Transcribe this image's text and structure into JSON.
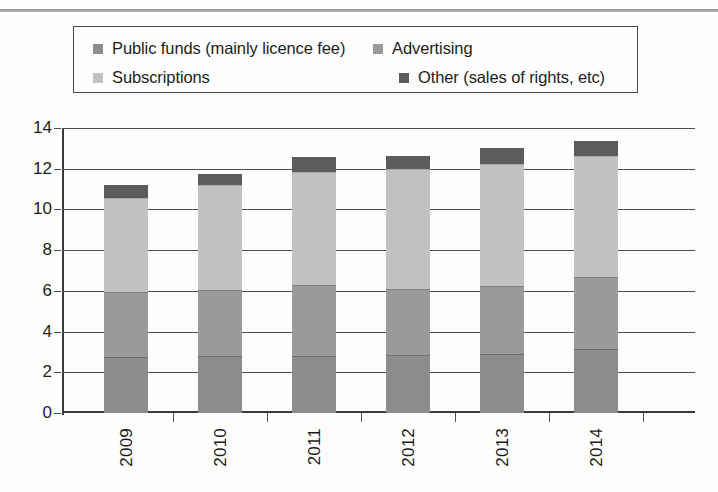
{
  "top_caption": "",
  "legend": {
    "items": [
      {
        "label": "Public funds (mainly licence fee)",
        "color": "#8d8d8d",
        "key": "public_funds"
      },
      {
        "label": "Advertising",
        "color": "#9a9a9a",
        "key": "advertising"
      },
      {
        "label": "Subscriptions",
        "color": "#c2c2c2",
        "key": "subscriptions"
      },
      {
        "label": "Other (sales of rights, etc)",
        "color": "#5c5c5c",
        "key": "other"
      }
    ]
  },
  "axis": {
    "y_ticks": [
      "0",
      "2",
      "4",
      "6",
      "8",
      "10",
      "12",
      "14"
    ],
    "x_ticks": [
      "2009",
      "2010",
      "2011",
      "2012",
      "2013",
      "2014"
    ]
  },
  "chart_data": {
    "type": "bar",
    "stacked": true,
    "title": "",
    "subtitle": "",
    "xlabel": "",
    "ylabel": "",
    "ylim": [
      0,
      14
    ],
    "ytick_step": 2,
    "grid": true,
    "legend_position": "top",
    "orientation": "vertical",
    "categories": [
      "2009",
      "2010",
      "2011",
      "2012",
      "2013",
      "2014"
    ],
    "series": [
      {
        "name": "Public funds (mainly licence fee)",
        "color": "#8d8d8d",
        "values": [
          2.7,
          2.75,
          2.75,
          2.8,
          2.85,
          3.1
        ]
      },
      {
        "name": "Advertising",
        "color": "#9a9a9a",
        "values": [
          3.15,
          3.2,
          3.45,
          3.2,
          3.3,
          3.5
        ]
      },
      {
        "name": "Subscriptions",
        "color": "#c2c2c2",
        "values": [
          4.55,
          5.1,
          5.5,
          5.85,
          5.95,
          5.9
        ]
      },
      {
        "name": "Other (sales of rights, etc)",
        "color": "#5c5c5c",
        "values": [
          0.65,
          0.55,
          0.75,
          0.65,
          0.75,
          0.7
        ]
      }
    ],
    "totals": [
      11.05,
      11.6,
      12.45,
      12.5,
      12.85,
      13.2
    ]
  }
}
